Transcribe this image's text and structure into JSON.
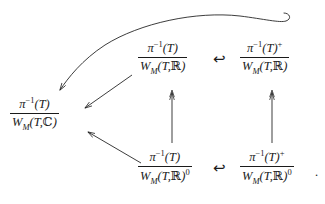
{
  "diagram": {
    "type": "commutative-diagram",
    "background_color": "#ffffff",
    "stroke_color": "#1a1a1a",
    "nodes": [
      {
        "id": "left",
        "name": "quotient-pi-inverse-T-by-WM-T-C",
        "numerator": "π⁻¹(T)",
        "denominator": "W_M(T,ℂ)",
        "numerator_parts": {
          "base": "π",
          "exponent": "−1",
          "arg": "(T)"
        },
        "denominator_parts": {
          "base": "W",
          "subscript": "M",
          "arg": "(T,ℂ)",
          "power": ""
        },
        "position": {
          "x": 10,
          "y": 96
        }
      },
      {
        "id": "top-middle",
        "name": "quotient-pi-inverse-T-by-WM-T-R",
        "numerator": "π⁻¹(T)",
        "denominator": "W_M(T,ℝ)",
        "numerator_parts": {
          "base": "π",
          "exponent": "−1",
          "arg": "(T)"
        },
        "denominator_parts": {
          "base": "W",
          "subscript": "M",
          "arg": "(T,ℝ)",
          "power": ""
        },
        "position": {
          "x": 138,
          "y": 40
        }
      },
      {
        "id": "top-right",
        "name": "quotient-pi-inverse-T-plus-by-WM-T-R",
        "numerator": "π⁻¹(T)⁺",
        "denominator": "W_M(T,ℝ)",
        "numerator_parts": {
          "base": "π",
          "exponent": "−1",
          "arg": "(T)",
          "post": "+"
        },
        "denominator_parts": {
          "base": "W",
          "subscript": "M",
          "arg": "(T,ℝ)",
          "power": ""
        },
        "position": {
          "x": 240,
          "y": 40
        }
      },
      {
        "id": "bottom-middle",
        "name": "quotient-pi-inverse-T-by-WM-T-R-zero",
        "numerator": "π⁻¹(T)",
        "denominator": "W_M(T,ℝ)⁰",
        "numerator_parts": {
          "base": "π",
          "exponent": "−1",
          "arg": "(T)"
        },
        "denominator_parts": {
          "base": "W",
          "subscript": "M",
          "arg": "(T,ℝ)",
          "power": "0"
        },
        "position": {
          "x": 138,
          "y": 149
        }
      },
      {
        "id": "bottom-right",
        "name": "quotient-pi-inverse-T-plus-by-WM-T-R-zero",
        "numerator": "π⁻¹(T)⁺",
        "denominator": "W_M(T,ℝ)⁰",
        "numerator_parts": {
          "base": "π",
          "exponent": "−1",
          "arg": "(T)",
          "post": "+"
        },
        "denominator_parts": {
          "base": "W",
          "subscript": "M",
          "arg": "(T,ℝ)",
          "power": "0"
        },
        "position": {
          "x": 240,
          "y": 149
        }
      }
    ],
    "arrows": [
      {
        "id": "top-hook",
        "name": "hook-arrow-top-right-to-top-middle",
        "glyph": "↩",
        "kind": "hooked-inclusion-left",
        "position": {
          "x": 213,
          "y": 52
        }
      },
      {
        "id": "bottom-hook",
        "name": "hook-arrow-bottom-right-to-bottom-middle",
        "glyph": "↩",
        "kind": "hooked-inclusion-left",
        "position": {
          "x": 213,
          "y": 161
        }
      },
      {
        "id": "vert-middle",
        "name": "double-head-arrow-bottom-middle-to-top-middle",
        "kind": "surjection-up"
      },
      {
        "id": "vert-right",
        "name": "double-head-arrow-bottom-right-to-top-right",
        "kind": "surjection-up"
      },
      {
        "id": "diag-upper",
        "name": "arrow-top-middle-to-left",
        "kind": "plain-diagonal-down-left"
      },
      {
        "id": "diag-lower",
        "name": "arrow-bottom-middle-to-left",
        "kind": "plain-diagonal-up-left"
      },
      {
        "id": "curve",
        "name": "curved-arrow-top-right-to-left",
        "kind": "curved-long-with-tail-hook"
      }
    ],
    "punctuation": {
      "trailing_period": "."
    }
  }
}
